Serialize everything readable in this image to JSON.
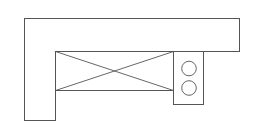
{
  "diagram": {
    "type": "kitchen-floor-plan",
    "colors": {
      "background": "#ffffff",
      "line": "#555555"
    },
    "elements": {
      "l_counter": {
        "label": "L-shaped counter",
        "points": "24.5,18.5 239.5,18.5 239.5,51.5 55.5,51.5 55.5,120.5 24.5,120.5"
      },
      "appliance_box": {
        "label": "appliance / opening (X box)",
        "x": 55.5,
        "y": 51.5,
        "w": 118,
        "h": 39
      },
      "cooktop": {
        "label": "two-burner cooktop",
        "x": 173.5,
        "y": 51.5,
        "w": 30,
        "h": 53,
        "burners": [
          {
            "cx": 189,
            "cy": 68.5,
            "r": 7.3
          },
          {
            "cx": 189,
            "cy": 88,
            "r": 7.3
          }
        ]
      }
    }
  }
}
